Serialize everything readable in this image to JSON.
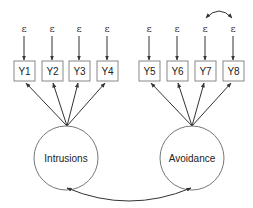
{
  "diagram": {
    "type": "structural-equation-model",
    "error_symbol": "ε",
    "latent_factors": [
      {
        "id": "intrusions",
        "label": "Intrusions",
        "indicators": [
          "Y1",
          "Y2",
          "Y3",
          "Y4"
        ]
      },
      {
        "id": "avoidance",
        "label": "Avoidance",
        "indicators": [
          "Y5",
          "Y6",
          "Y7",
          "Y8"
        ]
      }
    ],
    "observed": [
      {
        "label": "Y1",
        "error": "ε"
      },
      {
        "label": "Y2",
        "error": "ε"
      },
      {
        "label": "Y3",
        "error": "ε"
      },
      {
        "label": "Y4",
        "error": "ε"
      },
      {
        "label": "Y5",
        "error": "ε"
      },
      {
        "label": "Y6",
        "error": "ε"
      },
      {
        "label": "Y7",
        "error": "ε"
      },
      {
        "label": "Y8",
        "error": "ε"
      }
    ],
    "covariances": [
      {
        "between": [
          "Intrusions",
          "Avoidance"
        ]
      },
      {
        "between": [
          "ε(Y7)",
          "ε(Y8)"
        ]
      }
    ]
  }
}
